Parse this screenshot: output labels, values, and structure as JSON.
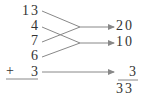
{
  "left_column": {
    "items": [
      "13",
      "4",
      "7",
      "6",
      "3"
    ],
    "operator": "+"
  },
  "right_column": {
    "items": [
      "20",
      "10",
      "3"
    ],
    "total": "33"
  },
  "pairings": [
    {
      "from": [
        "13",
        "7"
      ],
      "to": "20"
    },
    {
      "from": [
        "4",
        "6"
      ],
      "to": "10"
    },
    {
      "from": [
        "3"
      ],
      "to": "3"
    }
  ],
  "colors": {
    "text": "#333333",
    "line": "#888888"
  }
}
